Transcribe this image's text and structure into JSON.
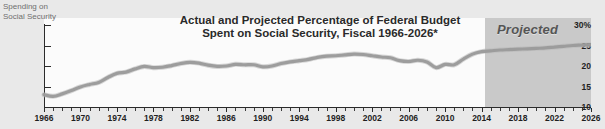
{
  "corner_label": {
    "line1": "Spending on",
    "line2": "Social Security"
  },
  "title": {
    "line1": "Actual and Projected Percentage of Federal Budget",
    "line2": "Spent on Social Security, Fiscal 1966-2026*"
  },
  "annotations": {
    "projected": "Projected"
  },
  "colors": {
    "line": "#9a9a9a",
    "projected_band": "#c9c9c9",
    "plot_background": "#fbfbfb",
    "page_background": "#e9e9e9",
    "axis": "#2b2b2b"
  },
  "chart_data": {
    "type": "line",
    "title": "Actual and Projected Percentage of Federal Budget Spent on Social Security, Fiscal 1966-2026*",
    "xlabel": "",
    "ylabel": "Spending on Social Security",
    "xlim": [
      1966,
      2026
    ],
    "ylim": [
      10,
      30
    ],
    "yticks": [
      "30%",
      "25",
      "20",
      "15",
      "10"
    ],
    "ytick_values": [
      30,
      25,
      20,
      15,
      10
    ],
    "xticks": [
      1966,
      1970,
      1974,
      1978,
      1982,
      1986,
      1990,
      1994,
      1998,
      2002,
      2006,
      2010,
      2014,
      2018,
      2022,
      2026
    ],
    "grid": false,
    "legend": false,
    "projection_start": 2016,
    "series": [
      {
        "name": "Percentage of federal budget spent on Social Security",
        "x": [
          1966,
          1967,
          1968,
          1969,
          1970,
          1971,
          1972,
          1973,
          1974,
          1975,
          1976,
          1977,
          1978,
          1979,
          1980,
          1981,
          1982,
          1983,
          1984,
          1985,
          1986,
          1987,
          1988,
          1989,
          1990,
          1991,
          1992,
          1993,
          1994,
          1995,
          1996,
          1997,
          1998,
          1999,
          2000,
          2001,
          2002,
          2003,
          2004,
          2005,
          2006,
          2007,
          2008,
          2009,
          2010,
          2011,
          2012,
          2013,
          2014,
          2015,
          2016,
          2017,
          2018,
          2019,
          2020,
          2021,
          2022,
          2023,
          2024,
          2025,
          2026
        ],
        "values": [
          13.0,
          12.6,
          13.2,
          14.0,
          14.9,
          15.5,
          16.0,
          17.2,
          18.2,
          18.5,
          19.3,
          19.9,
          19.6,
          19.7,
          20.1,
          20.6,
          20.9,
          20.7,
          20.2,
          19.9,
          20.0,
          20.4,
          20.3,
          20.3,
          19.8,
          20.0,
          20.6,
          21.0,
          21.3,
          21.6,
          22.1,
          22.4,
          22.5,
          22.7,
          22.9,
          22.8,
          22.5,
          22.2,
          22.0,
          21.3,
          21.1,
          21.4,
          21.0,
          19.6,
          20.4,
          20.3,
          21.7,
          22.9,
          23.5,
          23.7,
          23.9,
          24.0,
          24.1,
          24.2,
          24.3,
          24.4,
          24.6,
          24.8,
          25.0,
          25.1,
          25.2
        ]
      }
    ]
  }
}
